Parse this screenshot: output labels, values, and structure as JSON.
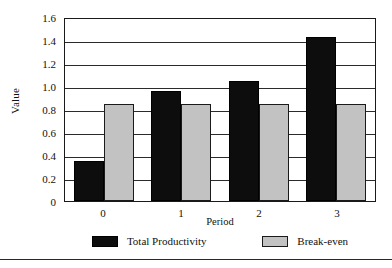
{
  "chart_data": {
    "type": "bar",
    "title": "",
    "xlabel": "Period",
    "ylabel": "Value",
    "categories": [
      "0",
      "1",
      "2",
      "3"
    ],
    "series": [
      {
        "name": "Total Productivity",
        "color": "#0d0d0d",
        "values": [
          0.35,
          0.96,
          1.04,
          1.43
        ]
      },
      {
        "name": "Break-even",
        "color": "#c2c2c2",
        "values": [
          0.84,
          0.84,
          0.84,
          0.84
        ]
      }
    ],
    "ylim": [
      0,
      1.6
    ],
    "ytick_values": [
      0,
      0.2,
      0.4,
      0.6,
      0.8,
      1.0,
      1.2,
      1.4,
      1.6
    ],
    "ytick_labels": [
      "0",
      "0.2",
      "0.4",
      "0.6",
      "0.8",
      "1.0",
      "1.2",
      "1.4",
      "1.6"
    ],
    "grid": "horizontal",
    "legend_position": "bottom",
    "bar_mode": "grouped"
  }
}
